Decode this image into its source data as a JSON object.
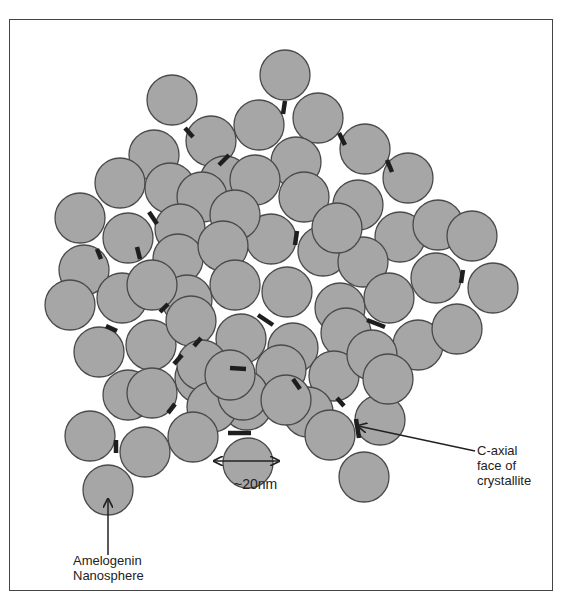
{
  "figure": {
    "type": "schematic"
  },
  "colors": {
    "sphere_fill": "#a6a6a6",
    "sphere_stroke": "#4a4a4a",
    "rod": "#1e1e1e",
    "frame": "#444444",
    "text": "#222222"
  },
  "labels": {
    "amelogenin": {
      "line1": "Amelogenin",
      "line2": "Nanosphere"
    },
    "caxial": {
      "line1": "C-axial",
      "line2": "face of",
      "line3": "crystallite"
    },
    "scale": "~20nm"
  },
  "sphere_radius": 25,
  "spheres": [
    [
      285,
      75
    ],
    [
      172,
      100
    ],
    [
      318,
      118
    ],
    [
      259,
      125
    ],
    [
      211,
      141
    ],
    [
      365,
      149
    ],
    [
      154,
      155
    ],
    [
      296,
      162
    ],
    [
      225,
      181
    ],
    [
      408,
      178
    ],
    [
      120,
      183
    ],
    [
      170,
      188
    ],
    [
      202,
      197
    ],
    [
      304,
      197
    ],
    [
      358,
      205
    ],
    [
      255,
      180
    ],
    [
      80,
      218
    ],
    [
      128,
      238
    ],
    [
      180,
      229
    ],
    [
      271,
      239
    ],
    [
      235,
      215
    ],
    [
      323,
      251
    ],
    [
      400,
      237
    ],
    [
      438,
      225
    ],
    [
      472,
      236
    ],
    [
      84,
      270
    ],
    [
      178,
      259
    ],
    [
      223,
      246
    ],
    [
      363,
      262
    ],
    [
      337,
      228
    ],
    [
      122,
      298
    ],
    [
      70,
      305
    ],
    [
      187,
      300
    ],
    [
      235,
      285
    ],
    [
      287,
      292
    ],
    [
      340,
      308
    ],
    [
      389,
      298
    ],
    [
      436,
      278
    ],
    [
      493,
      288
    ],
    [
      152,
      285
    ],
    [
      99,
      352
    ],
    [
      151,
      345
    ],
    [
      191,
      321
    ],
    [
      241,
      339
    ],
    [
      293,
      348
    ],
    [
      346,
      333
    ],
    [
      418,
      345
    ],
    [
      457,
      329
    ],
    [
      128,
      395
    ],
    [
      200,
      378
    ],
    [
      281,
      370
    ],
    [
      247,
      405
    ],
    [
      202,
      365
    ],
    [
      152,
      393
    ],
    [
      334,
      376
    ],
    [
      372,
      355
    ],
    [
      308,
      412
    ],
    [
      212,
      407
    ],
    [
      90,
      436
    ],
    [
      145,
      452
    ],
    [
      193,
      437
    ],
    [
      243,
      395
    ],
    [
      286,
      400
    ],
    [
      330,
      435
    ],
    [
      380,
      420
    ],
    [
      248,
      463
    ],
    [
      364,
      477
    ],
    [
      108,
      490
    ],
    [
      230,
      375
    ],
    [
      388,
      379
    ]
  ],
  "rods": [
    [
      285,
      101,
      283,
      114
    ],
    [
      185,
      128,
      193,
      137
    ],
    [
      229,
      155,
      219,
      165
    ],
    [
      339,
      133,
      345,
      145
    ],
    [
      387,
      160,
      392,
      172
    ],
    [
      149,
      212,
      157,
      224
    ],
    [
      97,
      249,
      101,
      259
    ],
    [
      137,
      247,
      140,
      259
    ],
    [
      297,
      231,
      295,
      245
    ],
    [
      463,
      270,
      461,
      283
    ],
    [
      106,
      326,
      117,
      331
    ],
    [
      160,
      312,
      168,
      304
    ],
    [
      194,
      346,
      201,
      338
    ],
    [
      258,
      315,
      273,
      325
    ],
    [
      367,
      320,
      385,
      327
    ],
    [
      174,
      364,
      182,
      355
    ],
    [
      230,
      368,
      246,
      369
    ],
    [
      293,
      379,
      300,
      389
    ],
    [
      337,
      398,
      344,
      406
    ],
    [
      168,
      413,
      175,
      404
    ],
    [
      228,
      433,
      251,
      433
    ],
    [
      116,
      440,
      116,
      453
    ],
    [
      356,
      419,
      359,
      438
    ]
  ],
  "arrows": {
    "amelogenin": {
      "x1": 108,
      "y1": 555,
      "x2": 108,
      "y2": 499
    },
    "caxial": {
      "x1": 475,
      "y1": 451,
      "x2": 358,
      "y2": 426
    },
    "scale": {
      "x1": 214,
      "y1": 461,
      "x2": 279,
      "y2": 461
    }
  }
}
